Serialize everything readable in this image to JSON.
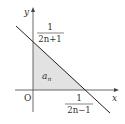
{
  "diagram": {
    "axes": {
      "x_label": "x",
      "y_label": "y",
      "origin_label": "O"
    },
    "y_intercept": {
      "numerator": "1",
      "denominator": "2n+1"
    },
    "x_intercept": {
      "numerator": "1",
      "denominator": "2n−1"
    },
    "region_label": "a",
    "region_label_subscript": "n",
    "colors": {
      "line": "#222222",
      "axis": "#444444",
      "shade": "#e2e2e2",
      "text": "#333333"
    }
  }
}
